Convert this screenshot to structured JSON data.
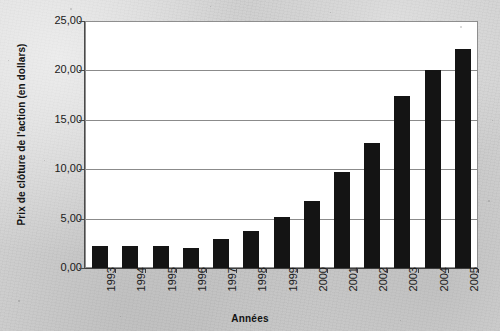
{
  "chart_data": {
    "type": "bar",
    "title": "",
    "xlabel": "Années",
    "ylabel": "Prix de clôture de l'action (en dollars)",
    "categories": [
      "1993",
      "1994",
      "1995",
      "1996",
      "1997",
      "1998",
      "1999",
      "2000",
      "2001",
      "2002",
      "2003",
      "2004",
      "2005"
    ],
    "values": [
      2.2,
      2.2,
      2.2,
      2.0,
      2.9,
      3.7,
      5.2,
      6.8,
      9.7,
      12.7,
      17.4,
      20.0,
      22.2
    ],
    "ylim": [
      0,
      25
    ],
    "ytick_labels": [
      "0,00",
      "5,00",
      "10,00",
      "15,00",
      "20,00",
      "25,00"
    ],
    "ytick_values": [
      0,
      5,
      10,
      15,
      20,
      25
    ],
    "grid": "horizontal",
    "legend": "none",
    "bar_color": "#141414",
    "plot_background": "#ffffff",
    "page_background": "#d1d1d1",
    "axis_color": "#3d3d3d",
    "gridline_color": "#8b8b8b"
  }
}
